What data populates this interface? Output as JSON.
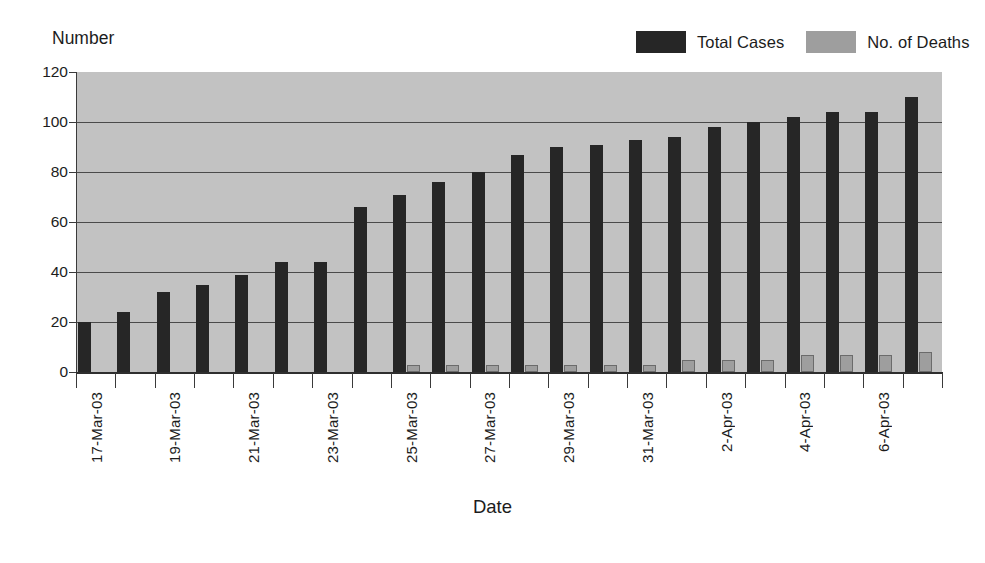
{
  "chart_data": {
    "type": "bar",
    "title": "",
    "xlabel": "Date",
    "ylabel": "Number",
    "ylim": [
      0,
      120
    ],
    "ytick_values": [
      0,
      20,
      40,
      60,
      80,
      100,
      120
    ],
    "ytick_labels": [
      "0",
      "20",
      "40",
      "60",
      "80",
      "100",
      "120"
    ],
    "grid": true,
    "legend_position": "top-right",
    "categories": [
      "17-Mar-03",
      "18-Mar-03",
      "19-Mar-03",
      "20-Mar-03",
      "21-Mar-03",
      "22-Mar-03",
      "23-Mar-03",
      "24-Mar-03",
      "25-Mar-03",
      "26-Mar-03",
      "27-Mar-03",
      "28-Mar-03",
      "29-Mar-03",
      "30-Mar-03",
      "31-Mar-03",
      "1-Apr-03",
      "2-Apr-03",
      "3-Apr-03",
      "4-Apr-03",
      "5-Apr-03",
      "6-Apr-03",
      "7-Apr-03"
    ],
    "xtick_labels_shown": [
      "17-Mar-03",
      "19-Mar-03",
      "21-Mar-03",
      "23-Mar-03",
      "25-Mar-03",
      "27-Mar-03",
      "29-Mar-03",
      "31-Mar-03",
      "2-Apr-03",
      "4-Apr-03",
      "6-Apr-03"
    ],
    "series": [
      {
        "name": "Total Cases",
        "color": "#262626",
        "values": [
          20,
          24,
          32,
          35,
          39,
          44,
          44,
          66,
          71,
          76,
          80,
          87,
          90,
          91,
          93,
          94,
          98,
          100,
          102,
          104,
          104,
          110
        ]
      },
      {
        "name": "No. of Deaths",
        "color": "#9e9e9e",
        "values": [
          0,
          0,
          0,
          0,
          0,
          0,
          0,
          0,
          3,
          3,
          3,
          3,
          3,
          3,
          3,
          5,
          5,
          5,
          7,
          7,
          7,
          8
        ]
      }
    ]
  },
  "legend": {
    "entries": [
      {
        "label": "Total Cases",
        "color": "#262626"
      },
      {
        "label": "No. of Deaths",
        "color": "#9e9e9e"
      }
    ]
  },
  "axes": {
    "y_title": "Number",
    "x_title": "Date"
  },
  "colors": {
    "plot_background": "#c2c2c2",
    "gridline": "#4a4a4a",
    "axis": "#3a3a3a",
    "text": "#1c1c1c",
    "page_background": "#ffffff"
  }
}
